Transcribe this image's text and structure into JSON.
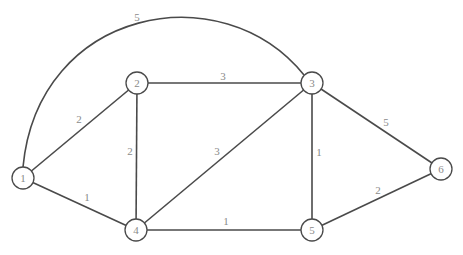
{
  "graph": {
    "type": "weighted-undirected-graph",
    "node_radius": 11,
    "colors": {
      "stroke": "#4a4a4a",
      "label": "#8a8a8a",
      "background": "#ffffff"
    },
    "nodes": [
      {
        "id": "1",
        "label": "1",
        "x": 23,
        "y": 178
      },
      {
        "id": "2",
        "label": "2",
        "x": 137,
        "y": 83
      },
      {
        "id": "3",
        "label": "3",
        "x": 312,
        "y": 83
      },
      {
        "id": "4",
        "label": "4",
        "x": 136,
        "y": 230
      },
      {
        "id": "5",
        "label": "5",
        "x": 312,
        "y": 230
      },
      {
        "id": "6",
        "label": "6",
        "x": 441,
        "y": 169
      }
    ],
    "edges": [
      {
        "from": "1",
        "to": "3",
        "weight": "5",
        "curved": true,
        "label_x": 137,
        "label_y": 17
      },
      {
        "from": "1",
        "to": "2",
        "weight": "2",
        "curved": false,
        "label_x": 79,
        "label_y": 119
      },
      {
        "from": "1",
        "to": "4",
        "weight": "1",
        "curved": false,
        "label_x": 87,
        "label_y": 197
      },
      {
        "from": "2",
        "to": "3",
        "weight": "3",
        "curved": false,
        "label_x": 223,
        "label_y": 76
      },
      {
        "from": "2",
        "to": "4",
        "weight": "2",
        "curved": false,
        "label_x": 130,
        "label_y": 151
      },
      {
        "from": "4",
        "to": "3",
        "weight": "3",
        "curved": false,
        "label_x": 217,
        "label_y": 151
      },
      {
        "from": "3",
        "to": "5",
        "weight": "1",
        "curved": false,
        "label_x": 319,
        "label_y": 152
      },
      {
        "from": "3",
        "to": "6",
        "weight": "5",
        "curved": false,
        "label_x": 386,
        "label_y": 122
      },
      {
        "from": "4",
        "to": "5",
        "weight": "1",
        "curved": false,
        "label_x": 226,
        "label_y": 221
      },
      {
        "from": "5",
        "to": "6",
        "weight": "2",
        "curved": false,
        "label_x": 378,
        "label_y": 190
      }
    ]
  }
}
